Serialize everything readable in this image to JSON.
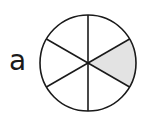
{
  "diagram": {
    "label": "a",
    "type": "fraction-circle",
    "total_parts": 6,
    "shaded_parts": 1,
    "colors": {
      "stroke": "#1a1a1a",
      "shade": "#e3e3e3",
      "background": "#ffffff"
    }
  }
}
